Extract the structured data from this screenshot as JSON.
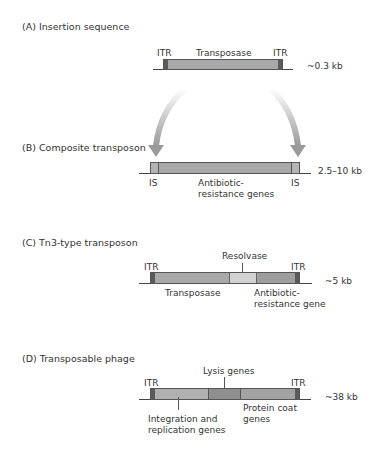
{
  "panels": {
    "A": {
      "heading": "(A) Insertion sequence",
      "labels": {
        "itr_left": "ITR",
        "transposase": "Transposase",
        "itr_right": "ITR"
      },
      "size": "~0.3 kb"
    },
    "B": {
      "heading": "(B) Composite transposon",
      "labels": {
        "is_left": "IS",
        "antibiotic_1": "Antibiotic-",
        "antibiotic_2": "resistance genes",
        "is_right": "IS"
      },
      "size": "2.5–10 kb"
    },
    "C": {
      "heading": "(C) Tn3-type transposon",
      "labels": {
        "itr_left": "ITR",
        "resolvase": "Resolvase",
        "itr_right": "ITR",
        "transposase": "Transposase",
        "antibiotic_1": "Antibiotic-",
        "antibiotic_2": "resistance gene"
      },
      "size": "~5 kb"
    },
    "D": {
      "heading": "(D) Transposable phage",
      "labels": {
        "itr_left": "ITR",
        "lysis": "Lysis genes",
        "itr_right": "ITR",
        "integration_1": "Integration and",
        "integration_2": "replication genes",
        "protein_1": "Protein coat",
        "protein_2": "genes"
      },
      "size": "~38 kb"
    }
  },
  "colors": {
    "segment": "#a9a9a9",
    "segment_light": "#d2d2d2",
    "segment_dark": "#8f8f8f",
    "itr": "#5a5a5a",
    "arrow": "#9a9a9a"
  }
}
